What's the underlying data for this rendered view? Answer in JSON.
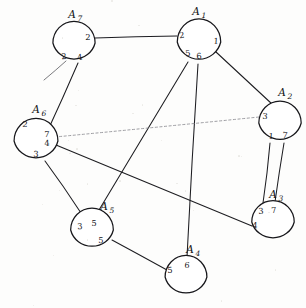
{
  "diagram": {
    "type": "node-link-diagram",
    "width": 306,
    "height": 308,
    "background_color": "#fdfdfc",
    "ink_color": "#1d1d21",
    "faint_ink_color": "#8d8d92"
  },
  "nodes": [
    {
      "id": "A1",
      "name": "A",
      "subscript": "1",
      "cx": 199,
      "cy": 42,
      "r": 22,
      "label_x": 196,
      "label_y": 12,
      "sub_dx": 8,
      "sub_dy": 4,
      "ports": [
        {
          "value": "2",
          "x": 182,
          "y": 36
        },
        {
          "value": "1",
          "x": 216,
          "y": 42
        },
        {
          "value": "5",
          "x": 188,
          "y": 54
        },
        {
          "value": "6",
          "x": 199,
          "y": 57
        }
      ]
    },
    {
      "id": "A2",
      "name": "A",
      "subscript": "2",
      "cx": 280,
      "cy": 123,
      "r": 21,
      "label_x": 282,
      "label_y": 93,
      "sub_dx": 8,
      "sub_dy": 4,
      "ports": [
        {
          "value": "3",
          "x": 265,
          "y": 117
        },
        {
          "value": "1",
          "x": 271,
          "y": 137
        },
        {
          "value": "7",
          "x": 285,
          "y": 136
        }
      ]
    },
    {
      "id": "A3",
      "name": "A",
      "subscript": "3",
      "cx": 273,
      "cy": 222,
      "r": 21,
      "label_x": 273,
      "label_y": 195,
      "sub_dx": 8,
      "sub_dy": 4,
      "ports": [
        {
          "value": "3",
          "x": 261,
          "y": 212
        },
        {
          "value": "7",
          "x": 274,
          "y": 211
        },
        {
          "value": "4",
          "x": 255,
          "y": 226
        }
      ]
    },
    {
      "id": "A4",
      "name": "A",
      "subscript": "4",
      "cx": 186,
      "cy": 277,
      "r": 21,
      "label_x": 190,
      "label_y": 250,
      "sub_dx": 8,
      "sub_dy": 4,
      "ports": [
        {
          "value": "6",
          "x": 187,
          "y": 266
        },
        {
          "value": "5",
          "x": 170,
          "y": 271
        }
      ]
    },
    {
      "id": "A5",
      "name": "A",
      "subscript": "5",
      "cx": 92,
      "cy": 230,
      "r": 21,
      "label_x": 104,
      "label_y": 207,
      "sub_dx": 8,
      "sub_dy": 4,
      "ports": [
        {
          "value": "3",
          "x": 80,
          "y": 227
        },
        {
          "value": "5",
          "x": 94,
          "y": 224
        },
        {
          "value": "5",
          "x": 101,
          "y": 241
        }
      ]
    },
    {
      "id": "A6",
      "name": "A",
      "subscript": "6",
      "cx": 36,
      "cy": 141,
      "r": 22,
      "label_x": 36,
      "label_y": 110,
      "sub_dx": 8,
      "sub_dy": 4,
      "ports": [
        {
          "value": "2",
          "x": 25,
          "y": 125
        },
        {
          "value": "7",
          "x": 47,
          "y": 135
        },
        {
          "value": "4",
          "x": 47,
          "y": 144
        },
        {
          "value": "3",
          "x": 36,
          "y": 155
        }
      ]
    },
    {
      "id": "A7",
      "name": "A",
      "subscript": "7",
      "cx": 74,
      "cy": 43,
      "r": 21,
      "label_x": 72,
      "label_y": 15,
      "sub_dx": 8,
      "sub_dy": 4,
      "ports": [
        {
          "value": "2",
          "x": 88,
          "y": 38
        },
        {
          "value": "2",
          "x": 64,
          "y": 57
        },
        {
          "value": "4",
          "x": 80,
          "y": 58
        }
      ]
    }
  ],
  "edges": [
    {
      "id": "e-A7-A1",
      "from": "A7",
      "to": "A1",
      "x1": 95,
      "y1": 38,
      "x2": 177,
      "y2": 36,
      "style": "solid"
    },
    {
      "id": "e-A7-A6",
      "from": "A7",
      "to": "A6",
      "x1": 78,
      "y1": 63,
      "x2": 48,
      "y2": 130,
      "style": "solid"
    },
    {
      "id": "e-A7-stub",
      "from": "A7",
      "to": "free",
      "x1": 66,
      "y1": 61,
      "x2": 44,
      "y2": 80,
      "style": "faint-stub"
    },
    {
      "id": "e-A1-A2",
      "from": "A1",
      "to": "A2",
      "x1": 216,
      "y1": 52,
      "x2": 272,
      "y2": 104,
      "style": "solid"
    },
    {
      "id": "e-A1-A5",
      "from": "A1",
      "to": "A5",
      "x1": 188,
      "y1": 62,
      "x2": 99,
      "y2": 210,
      "style": "solid"
    },
    {
      "id": "e-A1-A4",
      "from": "A1",
      "to": "A4",
      "x1": 198,
      "y1": 64,
      "x2": 187,
      "y2": 257,
      "style": "solid"
    },
    {
      "id": "e-A2-A3-a",
      "from": "A2",
      "to": "A3",
      "x1": 270,
      "y1": 143,
      "x2": 263,
      "y2": 203,
      "style": "solid"
    },
    {
      "id": "e-A2-A3-b",
      "from": "A2",
      "to": "A3",
      "x1": 284,
      "y1": 143,
      "x2": 275,
      "y2": 202,
      "style": "solid"
    },
    {
      "id": "e-A6-A2",
      "from": "A6",
      "to": "A2",
      "x1": 55,
      "y1": 137,
      "x2": 259,
      "y2": 117,
      "style": "faint-dotted"
    },
    {
      "id": "e-A6-A3",
      "from": "A6",
      "to": "A3",
      "x1": 56,
      "y1": 145,
      "x2": 252,
      "y2": 226,
      "style": "solid"
    },
    {
      "id": "e-A6-A5",
      "from": "A6",
      "to": "A5",
      "x1": 45,
      "y1": 161,
      "x2": 81,
      "y2": 213,
      "style": "solid"
    },
    {
      "id": "e-A5-A4",
      "from": "A5",
      "to": "A4",
      "x1": 112,
      "y1": 240,
      "x2": 167,
      "y2": 270,
      "style": "solid"
    }
  ]
}
